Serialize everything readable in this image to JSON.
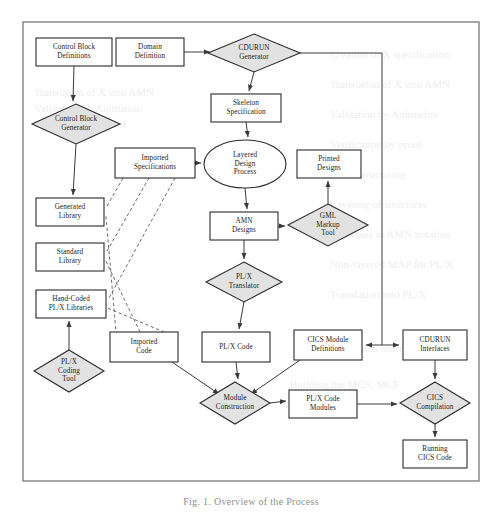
{
  "figure": {
    "caption": "Fig. 1.   Overview of the Process",
    "frame": {
      "x": 23,
      "y": 22,
      "width": 456,
      "height": 459
    }
  },
  "diagram": {
    "type": "flowchart",
    "shape_legend": {
      "box": "data / artifact",
      "diamond": "tool / transformation",
      "ellipse": "manual process"
    },
    "colors": {
      "node_fill": "#ffffff",
      "tool_fill": "#e2e2e2",
      "stroke": "#2a2a2a",
      "edge": "#3a3a3a",
      "dashed_edge": "#5a5a5a",
      "frame": "#6d6d6d",
      "caption": "#8e8e8e"
    },
    "nodes": [
      {
        "id": "control-block-definitions",
        "shape": "box",
        "label": "Control Block\nDefinitions",
        "x": 36,
        "y": 38,
        "w": 76,
        "h": 28
      },
      {
        "id": "domain-definition",
        "shape": "box",
        "label": "Domain\nDefinition",
        "x": 116,
        "y": 38,
        "w": 68,
        "h": 28
      },
      {
        "id": "cdurun-generator",
        "shape": "diamond",
        "label": "CDURUN\nGenerator",
        "x": 208,
        "y": 34,
        "w": 92,
        "h": 38
      },
      {
        "id": "control-block-generator",
        "shape": "diamond",
        "label": "Control Block\nGenerator",
        "x": 32,
        "y": 104,
        "w": 88,
        "h": 40
      },
      {
        "id": "skeleton-specification",
        "shape": "box",
        "label": "Skeleton\nSpecification",
        "x": 211,
        "y": 94,
        "w": 70,
        "h": 28
      },
      {
        "id": "imported-specifications",
        "shape": "box",
        "label": "Imported\nSpecifications",
        "x": 115,
        "y": 148,
        "w": 80,
        "h": 30
      },
      {
        "id": "layered-design-process",
        "shape": "ellipse",
        "label": "Layered\nDesign\nProcess",
        "x": 204,
        "y": 140,
        "w": 82,
        "h": 48
      },
      {
        "id": "printed-designs",
        "shape": "box",
        "label": "Printed\nDesigns",
        "x": 297,
        "y": 150,
        "w": 64,
        "h": 28
      },
      {
        "id": "generated-library",
        "shape": "box",
        "label": "Generated\nLibrary",
        "x": 36,
        "y": 198,
        "w": 68,
        "h": 28
      },
      {
        "id": "amn-designs",
        "shape": "box",
        "label": "AMN\nDesigns",
        "x": 210,
        "y": 212,
        "w": 68,
        "h": 28
      },
      {
        "id": "gml-markup-tool",
        "shape": "diamond",
        "label": "GML\nMarkup\nTool",
        "x": 288,
        "y": 204,
        "w": 80,
        "h": 42
      },
      {
        "id": "standard-library",
        "shape": "box",
        "label": "Standard\nLibrary",
        "x": 36,
        "y": 243,
        "w": 68,
        "h": 28
      },
      {
        "id": "plx-translator",
        "shape": "diamond",
        "label": "PL/X\nTranslator",
        "x": 206,
        "y": 262,
        "w": 76,
        "h": 40
      },
      {
        "id": "hand-coded-plx-libraries",
        "shape": "box",
        "label": "Hand-Coded\nPL/X Libraries",
        "x": 36,
        "y": 290,
        "w": 70,
        "h": 28
      },
      {
        "id": "imported-code",
        "shape": "box",
        "label": "Imported\nCode",
        "x": 110,
        "y": 332,
        "w": 68,
        "h": 30
      },
      {
        "id": "plx-code",
        "shape": "box",
        "label": "PL/X Code",
        "x": 202,
        "y": 332,
        "w": 68,
        "h": 30
      },
      {
        "id": "cics-module-definitions",
        "shape": "box",
        "label": "CICS Module\nDefinitions",
        "x": 294,
        "y": 330,
        "w": 68,
        "h": 30
      },
      {
        "id": "cdurun-interfaces",
        "shape": "box",
        "label": "CDURUN\nInterfaces",
        "x": 403,
        "y": 330,
        "w": 64,
        "h": 30
      },
      {
        "id": "plx-coding-tool",
        "shape": "diamond",
        "label": "PL/X\nCoding\nTool",
        "x": 34,
        "y": 350,
        "w": 70,
        "h": 42
      },
      {
        "id": "module-construction",
        "shape": "diamond",
        "label": "Module\nConstruction",
        "x": 200,
        "y": 382,
        "w": 70,
        "h": 42
      },
      {
        "id": "plx-code-modules",
        "shape": "box",
        "label": "PL/X Code\nModules",
        "x": 289,
        "y": 390,
        "w": 68,
        "h": 28
      },
      {
        "id": "cics-compilation",
        "shape": "diamond",
        "label": "CICS\nCompilation",
        "x": 400,
        "y": 382,
        "w": 70,
        "h": 42
      },
      {
        "id": "running-cics-code",
        "shape": "box",
        "label": "Running\nCICS Code",
        "x": 403,
        "y": 440,
        "w": 64,
        "h": 28
      }
    ],
    "edges": [
      {
        "from": "control-block-definitions",
        "to": "control-block-generator",
        "style": "solid"
      },
      {
        "from": "domain-definition",
        "to": "cdurun-generator",
        "style": "solid"
      },
      {
        "from": "cdurun-generator",
        "to": "skeleton-specification",
        "style": "solid"
      },
      {
        "from": "cdurun-generator",
        "to": "cics-module-definitions",
        "style": "solid"
      },
      {
        "from": "cdurun-generator",
        "to": "cdurun-interfaces",
        "style": "solid"
      },
      {
        "from": "control-block-generator",
        "to": "generated-library",
        "style": "solid"
      },
      {
        "from": "skeleton-specification",
        "to": "layered-design-process",
        "style": "solid"
      },
      {
        "from": "imported-specifications",
        "to": "layered-design-process",
        "style": "solid"
      },
      {
        "from": "layered-design-process",
        "to": "amn-designs",
        "style": "solid"
      },
      {
        "from": "amn-designs",
        "to": "gml-markup-tool",
        "style": "solid"
      },
      {
        "from": "gml-markup-tool",
        "to": "printed-designs",
        "style": "solid"
      },
      {
        "from": "amn-designs",
        "to": "plx-translator",
        "style": "solid"
      },
      {
        "from": "plx-translator",
        "to": "plx-code",
        "style": "solid"
      },
      {
        "from": "plx-coding-tool",
        "to": "hand-coded-plx-libraries",
        "style": "solid"
      },
      {
        "from": "imported-code",
        "to": "module-construction",
        "style": "solid"
      },
      {
        "from": "plx-code",
        "to": "module-construction",
        "style": "solid"
      },
      {
        "from": "cics-module-definitions",
        "to": "module-construction",
        "style": "solid"
      },
      {
        "from": "module-construction",
        "to": "plx-code-modules",
        "style": "solid"
      },
      {
        "from": "plx-code-modules",
        "to": "cics-compilation",
        "style": "solid"
      },
      {
        "from": "cdurun-interfaces",
        "to": "cics-compilation",
        "style": "solid"
      },
      {
        "from": "cics-compilation",
        "to": "running-cics-code",
        "style": "solid"
      },
      {
        "from": "imported-specifications",
        "to": "generated-library",
        "style": "dashed"
      },
      {
        "from": "imported-specifications",
        "to": "standard-library",
        "style": "dashed"
      },
      {
        "from": "imported-specifications",
        "to": "hand-coded-plx-libraries",
        "style": "dashed"
      },
      {
        "from": "generated-library",
        "to": "imported-code",
        "style": "dashed"
      },
      {
        "from": "standard-library",
        "to": "imported-code",
        "style": "dashed"
      },
      {
        "from": "hand-coded-plx-libraries",
        "to": "imported-code",
        "style": "dashed"
      }
    ]
  },
  "bleed_through": [
    {
      "text": "Translation of X into AMN",
      "x": 34,
      "y": 96
    },
    {
      "text": "Validation by Animation",
      "x": 34,
      "y": 112
    },
    {
      "text": "Verification by proof",
      "x": 34,
      "y": 128
    },
    {
      "text": "Creation of X specification",
      "x": 330,
      "y": 58
    },
    {
      "text": "Translation of X into AMN",
      "x": 330,
      "y": 88
    },
    {
      "text": "Validation by Animation",
      "x": 330,
      "y": 118
    },
    {
      "text": "Verification by proof",
      "x": 330,
      "y": 148
    },
    {
      "text": "AMN structuring",
      "x": 330,
      "y": 178
    },
    {
      "text": "Layering of structures",
      "x": 330,
      "y": 208
    },
    {
      "text": "Processes in AMN notation",
      "x": 330,
      "y": 238
    },
    {
      "text": "Non-layered MAP for PL/X",
      "x": 330,
      "y": 268
    },
    {
      "text": "Translation into PL/X",
      "x": 330,
      "y": 298
    },
    {
      "text": "Integration testing",
      "x": 330,
      "y": 352
    },
    {
      "text": "Building the MCS, MCF",
      "x": 290,
      "y": 388
    }
  ]
}
